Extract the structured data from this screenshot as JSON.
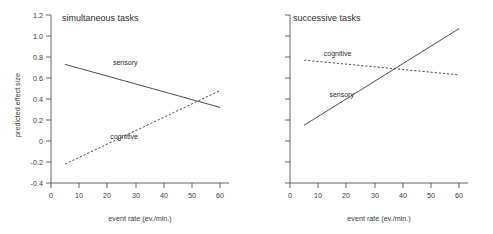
{
  "chart_data": [
    {
      "type": "line",
      "title": "simultaneous tasks",
      "xlabel": "event rate (ev./min.)",
      "ylabel": "predicted effect size",
      "xlim": [
        0,
        63
      ],
      "ylim": [
        -0.4,
        1.2
      ],
      "xticks": [
        0,
        10,
        20,
        30,
        40,
        50,
        60
      ],
      "xticklabels": [
        "0",
        "10",
        "20",
        "30",
        "40",
        "50",
        "60"
      ],
      "yticks": [
        -0.4,
        -0.2,
        0,
        0.2,
        0.4,
        0.6,
        0.8,
        1.0,
        1.2
      ],
      "yticklabels": [
        "-0.4",
        "-0.2",
        "0",
        "0.2",
        "0.4",
        "0.6",
        "0.8",
        "1.0",
        "1.2"
      ],
      "grid": false,
      "legend": "inline-annotations",
      "series": [
        {
          "name": "sensory",
          "style": "solid",
          "x": [
            5,
            60
          ],
          "values": [
            0.73,
            0.32
          ],
          "label_x": 22,
          "label_y": 0.72
        },
        {
          "name": "cognitive",
          "style": "dashed",
          "x": [
            5,
            60
          ],
          "values": [
            -0.22,
            0.48
          ],
          "label_x": 21,
          "label_y": 0.02
        }
      ]
    },
    {
      "type": "line",
      "title": "successive tasks",
      "xlabel": "event rate (ev./min.)",
      "ylabel": "",
      "xlim": [
        0,
        63
      ],
      "ylim": [
        -0.4,
        1.2
      ],
      "xticks": [
        0,
        10,
        20,
        30,
        40,
        50,
        60
      ],
      "xticklabels": [
        "0",
        "10",
        "20",
        "30",
        "40",
        "50",
        "60"
      ],
      "yticks": [
        -0.4,
        -0.2,
        0,
        0.2,
        0.4,
        0.6,
        0.8,
        1.0,
        1.2
      ],
      "yticklabels": [
        "",
        "",
        "",
        "",
        "",
        "",
        "",
        "",
        ""
      ],
      "grid": false,
      "legend": "inline-annotations",
      "series": [
        {
          "name": "sensory",
          "style": "solid",
          "x": [
            5,
            60
          ],
          "values": [
            0.15,
            1.07
          ],
          "label_x": 14,
          "label_y": 0.42
        },
        {
          "name": "cognitive",
          "style": "dashed",
          "x": [
            5,
            60
          ],
          "values": [
            0.77,
            0.63
          ],
          "label_x": 12,
          "label_y": 0.81
        }
      ]
    }
  ],
  "figure": {
    "background_color": "#ffffff",
    "line_color": "#3a3a3a",
    "axis_color": "#555555"
  }
}
